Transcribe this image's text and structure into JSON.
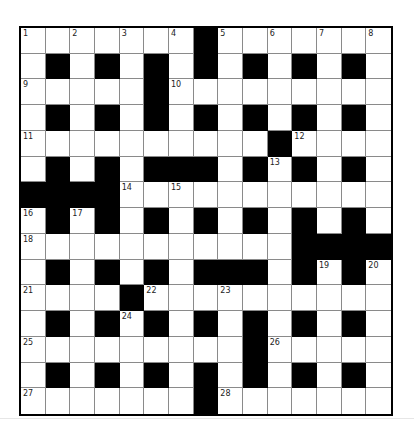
{
  "puzzle": {
    "rows": 15,
    "cols": 15,
    "colors": {
      "black": "#000000",
      "white": "#ffffff",
      "gridline": "#8a8a8a"
    },
    "layout": [
      "WWWWWWWBWWWWWWW",
      "WBWBWBWBWBWBWBW",
      "WWWWWBWWWWWWWWW",
      "WBWBWBWBWBWBWBW",
      "WWWWWWWWWWBWWWW",
      "WBWBWBBBWBWBWBW",
      "BBBBWWWWWWWWWWW",
      "WBWBWBWBWBWBWBW",
      "WWWWWWWWWWWBBBB",
      "WBWBWBWBBBWBWBW",
      "WWWWBWWWWWWWWWW",
      "WBWBWBWBWBWBWBW",
      "WWWWWWWWWBWWWWW",
      "WBWBWBWBWBWBWBW",
      "WWWWWWWBWWWWWWW"
    ],
    "numbers": [
      {
        "r": 0,
        "c": 0,
        "n": "1"
      },
      {
        "r": 0,
        "c": 2,
        "n": "2"
      },
      {
        "r": 0,
        "c": 4,
        "n": "3"
      },
      {
        "r": 0,
        "c": 6,
        "n": "4"
      },
      {
        "r": 0,
        "c": 8,
        "n": "5"
      },
      {
        "r": 0,
        "c": 10,
        "n": "6"
      },
      {
        "r": 0,
        "c": 12,
        "n": "7"
      },
      {
        "r": 0,
        "c": 14,
        "n": "8"
      },
      {
        "r": 2,
        "c": 0,
        "n": "9"
      },
      {
        "r": 2,
        "c": 6,
        "n": "10"
      },
      {
        "r": 4,
        "c": 0,
        "n": "11"
      },
      {
        "r": 4,
        "c": 11,
        "n": "12"
      },
      {
        "r": 5,
        "c": 10,
        "n": "13"
      },
      {
        "r": 6,
        "c": 4,
        "n": "14"
      },
      {
        "r": 6,
        "c": 6,
        "n": "15"
      },
      {
        "r": 7,
        "c": 0,
        "n": "16"
      },
      {
        "r": 7,
        "c": 2,
        "n": "17"
      },
      {
        "r": 8,
        "c": 0,
        "n": "18"
      },
      {
        "r": 9,
        "c": 12,
        "n": "19"
      },
      {
        "r": 9,
        "c": 14,
        "n": "20"
      },
      {
        "r": 10,
        "c": 0,
        "n": "21"
      },
      {
        "r": 10,
        "c": 5,
        "n": "22"
      },
      {
        "r": 10,
        "c": 8,
        "n": "23"
      },
      {
        "r": 11,
        "c": 4,
        "n": "24"
      },
      {
        "r": 12,
        "c": 0,
        "n": "25"
      },
      {
        "r": 12,
        "c": 10,
        "n": "26"
      },
      {
        "r": 14,
        "c": 0,
        "n": "27"
      },
      {
        "r": 14,
        "c": 8,
        "n": "28"
      }
    ]
  }
}
